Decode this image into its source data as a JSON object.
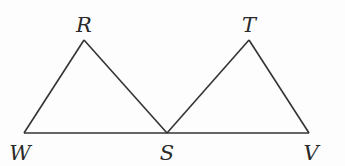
{
  "diagram": {
    "type": "geometry",
    "points": [
      {
        "id": "R",
        "label": "R",
        "x": 84,
        "y": 40,
        "lx": 84,
        "ly": 32
      },
      {
        "id": "T",
        "label": "T",
        "x": 249,
        "y": 40,
        "lx": 249,
        "ly": 32
      },
      {
        "id": "W",
        "label": "W",
        "x": 24,
        "y": 133,
        "lx": 20,
        "ly": 160
      },
      {
        "id": "S",
        "label": "S",
        "x": 167,
        "y": 133,
        "lx": 167,
        "ly": 160
      },
      {
        "id": "V",
        "label": "V",
        "x": 309,
        "y": 133,
        "lx": 311,
        "ly": 160
      }
    ],
    "segments": [
      [
        "W",
        "R"
      ],
      [
        "R",
        "S"
      ],
      [
        "S",
        "T"
      ],
      [
        "T",
        "V"
      ],
      [
        "W",
        "V"
      ]
    ],
    "stroke_color": "#333333",
    "label_color": "#2a2a2a"
  }
}
